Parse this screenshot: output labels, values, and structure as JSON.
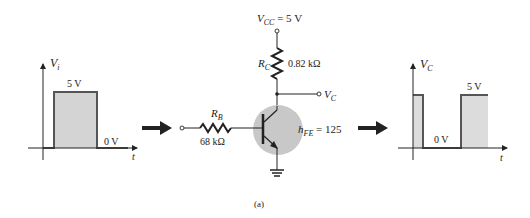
{
  "figure": {
    "caption": "(a)"
  },
  "input_waveform": {
    "axis_label": "V",
    "axis_label_sub": "i",
    "time_label": "t",
    "high_label": "5 V",
    "low_label": "0 V",
    "fill_color": "#d4d4d4",
    "line_color": "#555555"
  },
  "circuit": {
    "vcc_label": "V",
    "vcc_sub": "CC",
    "vcc_value": " = 5 V",
    "rc_label": "R",
    "rc_sub": "C",
    "rc_value": "0.82  kΩ",
    "rb_label": "R",
    "rb_sub": "B",
    "rb_value": "68  kΩ",
    "vc_label": "V",
    "vc_sub": "C",
    "hfe_label": "h",
    "hfe_sub": "FE",
    "hfe_value": " = 125",
    "transistor_fill": "#c8c8c8"
  },
  "output_waveform": {
    "axis_label": "V",
    "axis_label_sub": "C",
    "time_label": "t",
    "high_label": "5 V",
    "low_label": "0 V",
    "fill_color": "#dcdcdc",
    "line_color": "#555555"
  },
  "arrows": {
    "color": "#222222"
  }
}
